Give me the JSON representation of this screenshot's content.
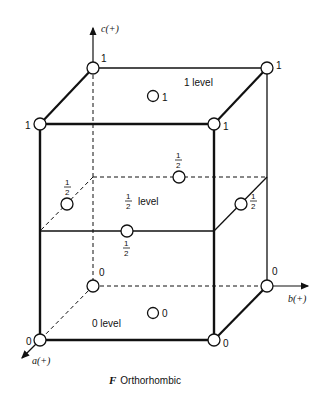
{
  "caption": {
    "italic": "F",
    "text": "Orthorhombic"
  },
  "axes": {
    "a": "a(+)",
    "b": "b(+)",
    "c": "c(+)"
  },
  "levels": {
    "top": "1 level",
    "middle": "level",
    "middle_frac": "1/2",
    "bottom": "0 level"
  },
  "corner_labels": {
    "back_top_left": "1",
    "back_top_right": "1",
    "front_top_left": "1",
    "front_top_right": "1",
    "back_bottom_left": "0",
    "back_bottom_right": "0",
    "front_bottom_left": "0",
    "front_bottom_right": "0"
  },
  "face_center_labels": {
    "top": "1",
    "bottom": "0",
    "back": "1/2",
    "left": "1/2",
    "right": "1/2",
    "front": "1/2"
  },
  "colors": {
    "line": "#111111",
    "background": "#ffffff"
  }
}
